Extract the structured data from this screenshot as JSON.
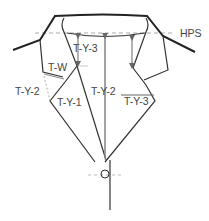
{
  "diagram": {
    "labels": {
      "hps": "HPS",
      "ty3_top": "T-Y-3",
      "tw": "T-W",
      "ty2_left": "T-Y-2",
      "ty1": "T-Y-1",
      "ty2_center": "T-Y-2",
      "ty3_right": "T-Y-3"
    },
    "colors": {
      "outline": "#222222",
      "measure": "#555555",
      "guide": "#aaaaaa"
    }
  }
}
